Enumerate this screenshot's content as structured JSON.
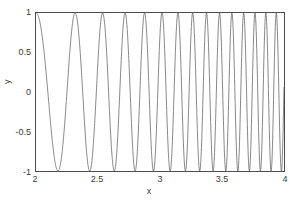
{
  "figure": {
    "background_color": "#ffffff",
    "axes_color": "#4d4d4d",
    "text_color": "#3a3a3a"
  },
  "axis": {
    "xlabel": "x",
    "ylabel": "y",
    "xticks": [
      "2",
      "2.5",
      "3",
      "3.5",
      "4"
    ],
    "yticks": [
      "1",
      "0.5",
      "0",
      "-0.5",
      "-1"
    ]
  },
  "chart_data": {
    "type": "line",
    "title": "",
    "xlabel": "x",
    "ylabel": "y",
    "xlim": [
      2,
      4
    ],
    "ylim": [
      -1,
      1
    ],
    "xticks": [
      2,
      2.5,
      3,
      3.5,
      4
    ],
    "yticks": [
      -1,
      -0.5,
      0,
      0.5,
      1
    ],
    "grid": false,
    "legend": null,
    "line_color": "#555555",
    "line_width": 0.8,
    "series": [
      {
        "name": "chirp",
        "formula": "y = cos(2*pi*(x-2)*(x-2)*2.5 + 2*pi*(x-2)*2.38)",
        "n_points": 1400,
        "peaks_x": [
          2.0,
          2.42,
          2.74,
          3.0,
          3.21,
          3.4,
          3.565,
          3.715,
          3.855,
          3.985
        ],
        "troughs_x": [
          2.22,
          2.6,
          2.875,
          3.11,
          3.31,
          3.485,
          3.645,
          3.79,
          3.925
        ],
        "approx_period_start": 0.42,
        "approx_period_end": 0.135,
        "ymin": -1,
        "ymax": 1
      }
    ]
  }
}
